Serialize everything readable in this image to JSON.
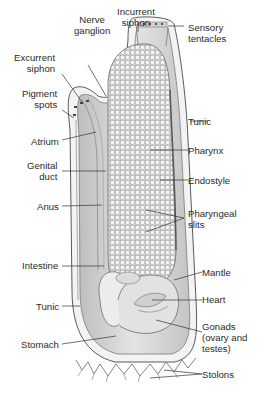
{
  "figure": {
    "labels": {
      "incurrent_siphon": "Incurrent\nsiphon",
      "nerve_ganglion": "Nerve\nganglion",
      "excurrent_siphon": "Excurrent\nsiphon",
      "sensory_tentacles": "Sensory\ntentacles",
      "pigment_spots": "Pigment\nspots",
      "tunic_top": "Tunic",
      "atrium": "Atrium",
      "pharynx": "Pharynx",
      "genital_duct": "Genital\nduct",
      "endostyle": "Endostyle",
      "anus": "Anus",
      "pharyngeal_slits": "Pharyngeal\nslits",
      "intestine": "Intestine",
      "mantle": "Mantle",
      "tunic_bottom": "Tunic",
      "heart": "Heart",
      "stomach": "Stomach",
      "gonads": "Gonads\n(ovary and\ntestes)",
      "stolons": "Stolons"
    },
    "colors": {
      "label_text": "#2a2a2a",
      "leader_line": "#333333",
      "tunic_fill": "#f2f2f2",
      "body_fill": "#d9d9d9",
      "pharynx_fill": "#e6e6e6",
      "outline": "#6a6a6a"
    }
  }
}
